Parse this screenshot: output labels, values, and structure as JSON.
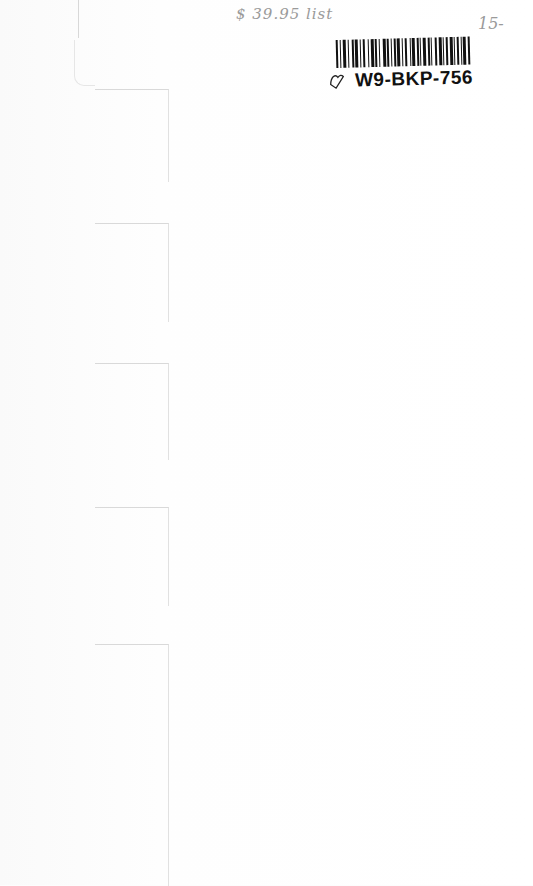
{
  "page": {
    "type": "scanned book inside page",
    "background_color": "#fdfdfd"
  },
  "annotations": {
    "list_price": "$ 39.95 list",
    "sale_price": "15-"
  },
  "sticker": {
    "code": "W9-BKP-756",
    "icon": "heart-outline-icon"
  },
  "tab_dividers": [
    {
      "top": 89,
      "height": 92
    },
    {
      "top": 223,
      "height": 98
    },
    {
      "top": 363,
      "height": 96
    },
    {
      "top": 507,
      "height": 98
    },
    {
      "top": 644,
      "height": 241
    }
  ]
}
